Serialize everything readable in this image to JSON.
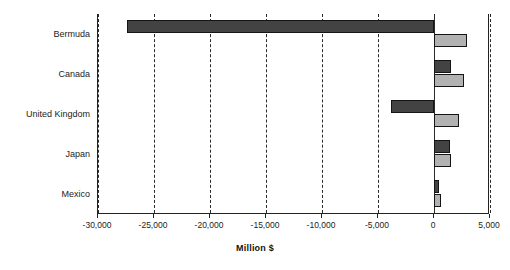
{
  "chart_data": {
    "type": "bar",
    "orientation": "horizontal",
    "title": "",
    "xlabel": "Million $",
    "ylabel": "",
    "xlim": [
      -30000,
      5000
    ],
    "xticks": [
      -30000,
      -25000,
      -20000,
      -15000,
      -10000,
      -5000,
      0,
      5000
    ],
    "xtick_labels": [
      "-30,000",
      "-25,000",
      "-20,000",
      "-15,000",
      "-10,000",
      "-5,000",
      "0",
      "5,000"
    ],
    "grid": true,
    "grid_axis": "x",
    "legend": null,
    "categories": [
      "Bermuda",
      "Canada",
      "United Kingdom",
      "Japan",
      "Mexico"
    ],
    "series": [
      {
        "name": "series-dark",
        "color": "#434343",
        "values": [
          -27400,
          1550,
          -3800,
          1400,
          450
        ]
      },
      {
        "name": "series-light",
        "color": "#b2b2b2",
        "values": [
          2950,
          2650,
          2200,
          1550,
          600
        ]
      }
    ]
  },
  "axis_title": "Million $"
}
